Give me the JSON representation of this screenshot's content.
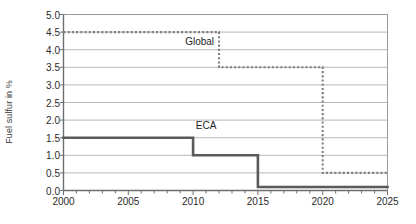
{
  "chart_data": {
    "type": "line",
    "title": "",
    "xlabel": "",
    "ylabel": "Fuel sulfur in %",
    "xlim": [
      2000,
      2025
    ],
    "ylim": [
      0.0,
      5.0
    ],
    "grid": "horizontal",
    "legend": "inline-annotations",
    "x_ticks": [
      2000,
      2005,
      2010,
      2015,
      2020,
      2025
    ],
    "x_tick_labels": [
      "2000",
      "2005",
      "2010",
      "2015",
      "2020",
      "2025"
    ],
    "x_minor_tick_interval": 1,
    "y_ticks": [
      0.0,
      0.5,
      1.0,
      1.5,
      2.0,
      2.5,
      3.0,
      3.5,
      4.0,
      4.5,
      5.0
    ],
    "y_tick_labels": [
      "0.0",
      "0.5",
      "1.0",
      "1.5",
      "2.0",
      "2.5",
      "3.0",
      "3.5",
      "4.0",
      "4.5",
      "5.0"
    ],
    "series": [
      {
        "name": "Global",
        "style": "dotted",
        "color": "#808080",
        "annotation": {
          "text": "Global",
          "x": 2010.5,
          "y": 4.22
        },
        "steps": [
          {
            "x_start": 2000,
            "x_end": 2012,
            "value": 4.5
          },
          {
            "x_start": 2012,
            "x_end": 2020,
            "value": 3.5
          },
          {
            "x_start": 2020,
            "x_end": 2025,
            "value": 0.5
          }
        ]
      },
      {
        "name": "ECA",
        "style": "solid",
        "color": "#5a5a5a",
        "annotation": {
          "text": "ECA",
          "x": 2011.0,
          "y": 1.82
        },
        "steps": [
          {
            "x_start": 2000,
            "x_end": 2010,
            "value": 1.5
          },
          {
            "x_start": 2010,
            "x_end": 2015,
            "value": 1.0
          },
          {
            "x_start": 2015,
            "x_end": 2025,
            "value": 0.1
          }
        ]
      }
    ]
  },
  "axes": {
    "frame_color": "#9a9a9a",
    "gridline_color": "#b8b8b8"
  }
}
